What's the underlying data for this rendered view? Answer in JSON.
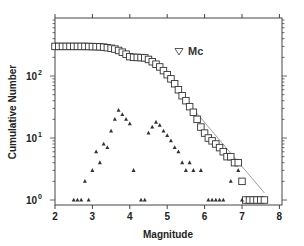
{
  "chart_data": {
    "type": "scatter",
    "title": "",
    "xlabel": "Magnitude",
    "ylabel": "Cumulative Number",
    "xlim": [
      2,
      8
    ],
    "ylim": [
      0.9,
      700
    ],
    "yscale": "log",
    "grid": false,
    "x_ticks": [
      "2",
      "3",
      "4",
      "5",
      "6",
      "7",
      "8"
    ],
    "y_ticks": [
      {
        "base": "10",
        "exp": "0",
        "value": 1
      },
      {
        "base": "10",
        "exp": "1",
        "value": 10
      },
      {
        "base": "10",
        "exp": "2",
        "value": 100
      }
    ],
    "legend": {
      "position": "upper-right-inside",
      "entries": [
        {
          "marker": "open-triangle-down",
          "label": "Mc"
        }
      ]
    },
    "series": [
      {
        "name": "Cumulative number",
        "marker": "open-square",
        "points": [
          [
            2.0,
            300
          ],
          [
            2.1,
            300
          ],
          [
            2.2,
            300
          ],
          [
            2.3,
            300
          ],
          [
            2.4,
            300
          ],
          [
            2.5,
            300
          ],
          [
            2.6,
            300
          ],
          [
            2.7,
            300
          ],
          [
            2.8,
            300
          ],
          [
            2.9,
            299
          ],
          [
            3.0,
            298
          ],
          [
            3.1,
            297
          ],
          [
            3.2,
            296
          ],
          [
            3.3,
            292
          ],
          [
            3.4,
            286
          ],
          [
            3.5,
            280
          ],
          [
            3.6,
            272
          ],
          [
            3.7,
            258
          ],
          [
            3.8,
            242
          ],
          [
            3.9,
            225
          ],
          [
            4.0,
            205
          ],
          [
            4.1,
            200
          ],
          [
            4.2,
            199
          ],
          [
            4.3,
            198
          ],
          [
            4.4,
            196
          ],
          [
            4.5,
            185
          ],
          [
            4.6,
            170
          ],
          [
            4.7,
            155
          ],
          [
            4.8,
            140
          ],
          [
            4.9,
            122
          ],
          [
            5.0,
            105
          ],
          [
            5.1,
            90
          ],
          [
            5.2,
            75
          ],
          [
            5.3,
            60
          ],
          [
            5.4,
            48
          ],
          [
            5.5,
            40
          ],
          [
            5.6,
            32
          ],
          [
            5.7,
            26
          ],
          [
            5.8,
            20
          ],
          [
            5.9,
            15
          ],
          [
            6.0,
            12
          ],
          [
            6.1,
            10
          ],
          [
            6.2,
            9
          ],
          [
            6.3,
            8
          ],
          [
            6.4,
            7
          ],
          [
            6.5,
            6
          ],
          [
            6.6,
            5
          ],
          [
            6.7,
            5
          ],
          [
            6.8,
            4
          ],
          [
            6.9,
            4
          ],
          [
            7.0,
            2
          ],
          [
            7.1,
            1
          ],
          [
            7.2,
            1
          ],
          [
            7.3,
            1
          ],
          [
            7.4,
            1
          ],
          [
            7.5,
            1
          ],
          [
            7.6,
            1
          ]
        ]
      },
      {
        "name": "Non-cumulative number",
        "marker": "filled-triangle",
        "points": [
          [
            2.5,
            1
          ],
          [
            2.6,
            1
          ],
          [
            2.7,
            1
          ],
          [
            2.8,
            2
          ],
          [
            2.9,
            1
          ],
          [
            3.0,
            3
          ],
          [
            3.1,
            6
          ],
          [
            3.2,
            4
          ],
          [
            3.3,
            8
          ],
          [
            3.4,
            7
          ],
          [
            3.5,
            13
          ],
          [
            3.6,
            20
          ],
          [
            3.7,
            28
          ],
          [
            3.8,
            24
          ],
          [
            3.9,
            20
          ],
          [
            4.0,
            17
          ],
          [
            4.1,
            3
          ],
          [
            4.3,
            1
          ],
          [
            4.4,
            1
          ],
          [
            4.5,
            12
          ],
          [
            4.6,
            15
          ],
          [
            4.7,
            18
          ],
          [
            4.8,
            16
          ],
          [
            4.9,
            13
          ],
          [
            5.0,
            11
          ],
          [
            5.1,
            9
          ],
          [
            5.2,
            7
          ],
          [
            5.3,
            6
          ],
          [
            5.4,
            4
          ],
          [
            5.5,
            3
          ],
          [
            5.6,
            4
          ],
          [
            5.7,
            3
          ],
          [
            5.9,
            3
          ],
          [
            6.1,
            1
          ],
          [
            6.2,
            1
          ],
          [
            6.3,
            1
          ],
          [
            6.4,
            1
          ],
          [
            6.5,
            1
          ],
          [
            6.7,
            2
          ],
          [
            6.9,
            3
          ],
          [
            7.0,
            1
          ]
        ]
      },
      {
        "name": "Gutenberg-Richter fit",
        "type": "line",
        "points": [
          [
            5.0,
            92
          ],
          [
            7.6,
            1.3
          ]
        ]
      },
      {
        "name": "Mc",
        "marker": "open-triangle-down",
        "points": [
          [
            4.45,
            225
          ]
        ]
      }
    ]
  },
  "layout": {
    "frame": {
      "left": 55,
      "right": 282,
      "top": 18,
      "bottom": 205
    },
    "x_px": {
      "min_value": 2,
      "min_px": 55,
      "per_unit": 37.4
    },
    "y_px": {
      "zero_px": 200,
      "per_decade": 62
    },
    "colors": {
      "axis": "#444444",
      "marker": "#333333",
      "fit_line": "#888888"
    }
  }
}
